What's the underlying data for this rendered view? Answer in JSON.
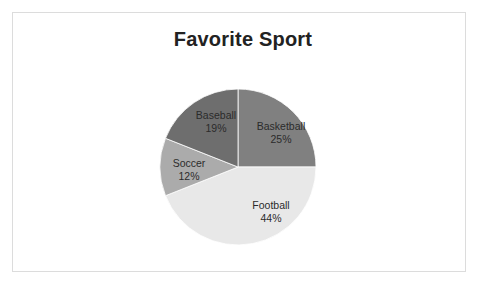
{
  "slide": {
    "background_color": "#ffffff",
    "frame_border_color": "#dcdcdc"
  },
  "chart_data": {
    "type": "pie",
    "title": "Favorite Sport",
    "xlabel": "",
    "ylabel": "",
    "legend": "none",
    "labels_inside_slices": true,
    "start_angle_deg": 0,
    "direction": "clockwise",
    "categories": [
      "Basketball",
      "Football",
      "Soccer",
      "Baseball"
    ],
    "values": [
      25,
      44,
      12,
      19
    ],
    "value_unit": "percent",
    "slices": [
      {
        "name": "Basketball",
        "value": 25,
        "percent_label": "25%",
        "color": "#808080",
        "label_x": 281,
        "label_y": 133
      },
      {
        "name": "Football",
        "value": 44,
        "percent_label": "44%",
        "color": "#e8e8e8",
        "label_x": 271,
        "label_y": 212
      },
      {
        "name": "Soccer",
        "value": 12,
        "percent_label": "12%",
        "color": "#ababab",
        "label_x": 189,
        "label_y": 170
      },
      {
        "name": "Baseball",
        "value": 19,
        "percent_label": "19%",
        "color": "#6e6e6e",
        "label_x": 216,
        "label_y": 122
      }
    ]
  }
}
